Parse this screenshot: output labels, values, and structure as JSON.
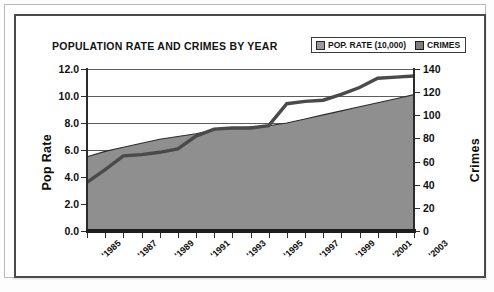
{
  "chart_data": {
    "type": "area",
    "title": "POPULATION RATE AND CRIMES BY YEAR",
    "xlabel": "",
    "categories": [
      "'1985",
      "'1986",
      "'1987",
      "'1988",
      "'1989",
      "'1990",
      "'1991",
      "'1992",
      "'1993",
      "'1994",
      "'1995",
      "'1996",
      "'1997",
      "'1998",
      "'1999",
      "'2000",
      "'2001",
      "'2002",
      "'2003"
    ],
    "tick_labels_shown": [
      "'1985",
      "'1987",
      "'1989",
      "'1991",
      "'1993",
      "'1995",
      "'1997",
      "'1999",
      "'2001",
      "'2003"
    ],
    "grid": true,
    "legend_position": "top-right",
    "axes": {
      "left": {
        "label": "Pop Rate",
        "ticks": [
          "0.0",
          "2.0",
          "4.0",
          "6.0",
          "8.0",
          "10.0",
          "12.0"
        ],
        "min": 0.0,
        "max": 12.0,
        "step": 2.0
      },
      "right": {
        "label": "Crimes",
        "ticks": [
          "0",
          "20",
          "40",
          "60",
          "80",
          "100",
          "120",
          "140"
        ],
        "min": 0,
        "max": 140,
        "step": 20
      }
    },
    "series": [
      {
        "name": "POP. RATE (10,000)",
        "axis": "left",
        "render": "area",
        "color": "#8f8f8f",
        "values": [
          5.5,
          5.9,
          6.2,
          6.5,
          6.8,
          7.0,
          7.2,
          7.5,
          7.6,
          7.7,
          7.8,
          8.0,
          8.3,
          8.6,
          8.9,
          9.2,
          9.5,
          9.8,
          10.1
        ]
      },
      {
        "name": "CRIMES",
        "axis": "right",
        "render": "line",
        "color": "#4a4a4a",
        "values": [
          42,
          53,
          65,
          66,
          68,
          71,
          82,
          88,
          89,
          89,
          91,
          110,
          112,
          113,
          118,
          124,
          132,
          133,
          134
        ]
      }
    ]
  },
  "legend": {
    "items": [
      {
        "label": "POP. RATE (10,000)",
        "swatch": "series-marker-icon"
      },
      {
        "label": "CRIMES",
        "swatch": "series-marker-icon"
      }
    ]
  }
}
